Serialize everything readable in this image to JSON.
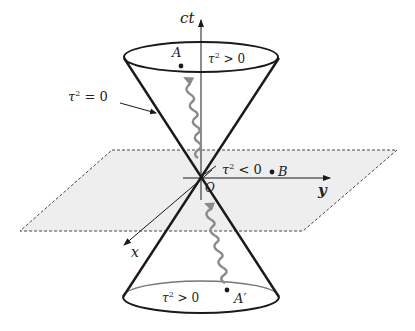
{
  "diagram": {
    "axes": {
      "time": "ct",
      "y": "y",
      "x": "x"
    },
    "origin_label": "O",
    "labels": {
      "future": {
        "tau": "τ",
        "sup": "2",
        "rel": " > 0"
      },
      "past": {
        "tau": "τ",
        "sup": "2",
        "rel": " > 0"
      },
      "spacelike": {
        "tau": "τ",
        "sup": "2",
        "rel": " < 0"
      },
      "lightlike": {
        "tau": "τ",
        "sup": "2",
        "rel": " = 0"
      }
    },
    "points": {
      "A": "A",
      "A_prime": "A′",
      "B": "B"
    },
    "colors": {
      "line": "#1a1a1a",
      "plane_fill": "#eeeeee",
      "plane_border": "#444444",
      "wave": "#8a8a8a"
    }
  }
}
